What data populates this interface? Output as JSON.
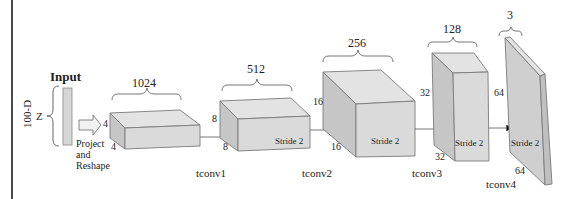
{
  "input": {
    "title": "Input",
    "vector_label": "Z",
    "dimension_label": "100-D",
    "project_lines": [
      "Project",
      "and",
      "Reshape"
    ]
  },
  "layers": [
    {
      "name": "project",
      "depth_label": "1024",
      "height_label": "4",
      "width_label": "4",
      "stride_label": "",
      "op_label": ""
    },
    {
      "name": "tconv1",
      "depth_label": "512",
      "height_label": "8",
      "width_label": "8",
      "stride_label": "Stride 2",
      "op_label": "tconv1"
    },
    {
      "name": "tconv2",
      "depth_label": "256",
      "height_label": "16",
      "width_label": "16",
      "stride_label": "Stride 2",
      "op_label": "tconv2"
    },
    {
      "name": "tconv3",
      "depth_label": "128",
      "height_label": "32",
      "width_label": "32",
      "stride_label": "Stride 2",
      "op_label": "tconv3"
    },
    {
      "name": "tconv4",
      "depth_label": "3",
      "height_label": "64",
      "width_label": "64",
      "stride_label": "Stride 2",
      "op_label": "tconv4"
    }
  ],
  "colors": {
    "front": "#d9d9d9",
    "top": "#e4e4e4",
    "side": "#c4c4c4",
    "stroke": "#7a7a7a",
    "text": "#222222"
  }
}
